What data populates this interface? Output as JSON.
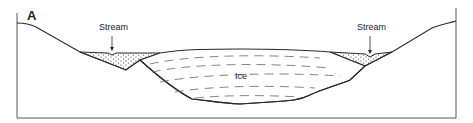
{
  "figure": {
    "panel_label": "A",
    "labels": {
      "stream_left": "Stream",
      "stream_right": "Stream",
      "ice": "Ice"
    },
    "colors": {
      "line": "#2a2a2a",
      "frame": "#555555",
      "dash": "#666666",
      "background": "#ffffff"
    }
  }
}
